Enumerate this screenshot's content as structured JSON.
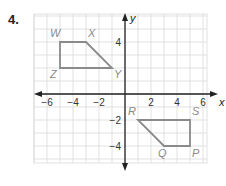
{
  "problem": {
    "number": "4."
  },
  "chart_data": {
    "type": "scatter",
    "title": "",
    "xlabel": "x",
    "ylabel": "y",
    "xlim": [
      -7,
      6.5
    ],
    "ylim": [
      -6,
      6.3
    ],
    "grid": true,
    "x_ticks": [
      -6,
      -4,
      -2,
      2,
      4,
      6
    ],
    "y_ticks": [
      4,
      -2,
      -4
    ],
    "x_tick_labels": [
      "−6",
      "−4",
      "−2",
      "2",
      "4",
      "6"
    ],
    "y_tick_labels": [
      "4",
      "−2",
      "−4"
    ],
    "polygons": [
      {
        "name": "WXYZ",
        "color": "#8a8a8a",
        "vertices": [
          {
            "label": "W",
            "x": -5,
            "y": 4
          },
          {
            "label": "X",
            "x": -3,
            "y": 4
          },
          {
            "label": "Y",
            "x": -1,
            "y": 2
          },
          {
            "label": "Z",
            "x": -5,
            "y": 2
          }
        ]
      },
      {
        "name": "RSPQ",
        "color": "#8a8a8a",
        "vertices": [
          {
            "label": "R",
            "x": 1,
            "y": -2
          },
          {
            "label": "S",
            "x": 5,
            "y": -2
          },
          {
            "label": "P",
            "x": 5,
            "y": -4
          },
          {
            "label": "Q",
            "x": 3,
            "y": -4
          }
        ]
      }
    ]
  }
}
